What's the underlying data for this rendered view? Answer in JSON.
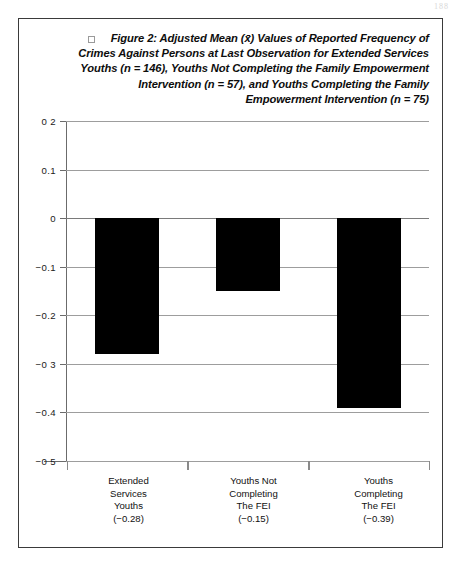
{
  "page": {
    "scan_artifact": "188"
  },
  "figure": {
    "caption_bullet_icon": "empty-square-icon",
    "caption_lines": [
      "Figure 2: Adjusted Mean (x̄) Values of Reported Frequency of",
      "Crimes Against Persons at Last Observation for Extended Services",
      "Youths (n = 146), Youths Not Completing the Family Empowerment",
      "Intervention (n = 57), and Youths Completing the  Family",
      "Empowerment Intervention  (n = 75)"
    ]
  },
  "chart_data": {
    "type": "bar",
    "xlabel": "",
    "ylabel": "",
    "ylim": [
      -0.5,
      0.2
    ],
    "grid": true,
    "legend": "none",
    "bar_color": "#000000",
    "categories": [
      "Extended Services Youths",
      "Youths Not Completing The FEI",
      "Youths Completing The FEI"
    ],
    "category_label_lines": [
      [
        "Extended",
        "Services",
        "Youths",
        "(−0.28)"
      ],
      [
        "Youths Not",
        "Completing",
        "The FEI",
        "(−0.15)"
      ],
      [
        "Youths",
        "Completing",
        "The FEI",
        "(−0.39)"
      ]
    ],
    "values": [
      -0.28,
      -0.15,
      -0.39
    ],
    "value_labels": [
      "(−0.28)",
      "(−0.15)",
      "(−0.39)"
    ],
    "sample_sizes": [
      146,
      57,
      75
    ],
    "ytick_values": [
      0.2,
      0.1,
      0,
      -0.1,
      -0.2,
      -0.3,
      -0.4,
      -0.5
    ],
    "ytick_labels": [
      "0 2",
      "0.1",
      "0",
      "−0.1",
      "−0.2",
      "−0 3",
      "−0.4",
      "−0 5"
    ]
  }
}
